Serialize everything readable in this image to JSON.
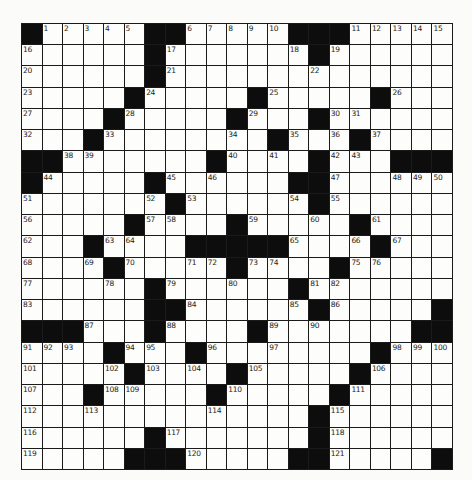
{
  "puzzle": {
    "rows": 21,
    "cols": 21,
    "legend": {
      "black": "#",
      "white": "."
    },
    "grid": [
      [
        "#",
        "1",
        "2",
        "3",
        "4",
        "5",
        "#",
        "#",
        "6",
        "7",
        "8",
        "9",
        "10",
        "#",
        "#",
        "#",
        "11",
        "12",
        "13",
        "14",
        "15"
      ],
      [
        "16",
        ".",
        ".",
        ".",
        ".",
        ".",
        "#",
        "17",
        ".",
        ".",
        ".",
        ".",
        ".",
        "18",
        "#",
        "19",
        ".",
        ".",
        ".",
        ".",
        "."
      ],
      [
        "20",
        ".",
        ".",
        ".",
        ".",
        ".",
        "#",
        "21",
        ".",
        ".",
        ".",
        ".",
        ".",
        ".",
        "22",
        ".",
        ".",
        ".",
        ".",
        ".",
        "."
      ],
      [
        "23",
        ".",
        ".",
        ".",
        ".",
        "#",
        "24",
        ".",
        ".",
        ".",
        ".",
        "#",
        "25",
        ".",
        ".",
        ".",
        ".",
        "#",
        "26",
        ".",
        "."
      ],
      [
        "27",
        ".",
        ".",
        ".",
        "#",
        "28",
        ".",
        ".",
        ".",
        ".",
        "#",
        "29",
        ".",
        ".",
        "#",
        "30",
        "31",
        ".",
        ".",
        ".",
        "."
      ],
      [
        "32",
        ".",
        ".",
        "#",
        "33",
        ".",
        ".",
        ".",
        ".",
        ".",
        "34",
        ".",
        "#",
        "35",
        ".",
        "36",
        "#",
        "37",
        ".",
        ".",
        "."
      ],
      [
        "#",
        "#",
        "38",
        "39",
        ".",
        ".",
        ".",
        ".",
        ".",
        "#",
        "40",
        ".",
        "41",
        ".",
        "#",
        "42",
        "43",
        ".",
        "#",
        "#",
        "#"
      ],
      [
        "#",
        "44",
        ".",
        ".",
        ".",
        ".",
        "#",
        "45",
        ".",
        "46",
        ".",
        ".",
        ".",
        "#",
        "#",
        "47",
        ".",
        ".",
        "48",
        "49",
        "50"
      ],
      [
        "51",
        ".",
        ".",
        ".",
        ".",
        ".",
        "52",
        "#",
        "53",
        ".",
        ".",
        ".",
        ".",
        "54",
        "#",
        "55",
        ".",
        ".",
        ".",
        ".",
        "."
      ],
      [
        "56",
        ".",
        ".",
        ".",
        ".",
        "#",
        "57",
        "58",
        ".",
        ".",
        "#",
        "59",
        ".",
        ".",
        "60",
        ".",
        "#",
        "61",
        ".",
        ".",
        "."
      ],
      [
        "62",
        ".",
        ".",
        "#",
        "63",
        "64",
        ".",
        ".",
        "#",
        "#",
        "#",
        "#",
        "#",
        "65",
        ".",
        ".",
        "66",
        "#",
        "67",
        ".",
        "."
      ],
      [
        "68",
        ".",
        ".",
        "69",
        "#",
        "70",
        ".",
        ".",
        "71",
        "72",
        "#",
        "73",
        "74",
        ".",
        ".",
        "#",
        "75",
        "76",
        ".",
        ".",
        "."
      ],
      [
        "77",
        ".",
        ".",
        ".",
        "78",
        ".",
        "#",
        "79",
        ".",
        ".",
        "80",
        ".",
        ".",
        "#",
        "81",
        "82",
        ".",
        ".",
        ".",
        ".",
        "."
      ],
      [
        "83",
        ".",
        ".",
        ".",
        ".",
        ".",
        "#",
        "#",
        "84",
        ".",
        ".",
        ".",
        ".",
        "85",
        "#",
        "86",
        ".",
        ".",
        ".",
        ".",
        "#"
      ],
      [
        "#",
        "#",
        "#",
        "87",
        ".",
        ".",
        "#",
        "88",
        ".",
        ".",
        ".",
        "#",
        "89",
        ".",
        "90",
        ".",
        ".",
        ".",
        ".",
        "#",
        "#"
      ],
      [
        "91",
        "92",
        "93",
        ".",
        "#",
        "94",
        "95",
        ".",
        "#",
        "96",
        ".",
        ".",
        "97",
        ".",
        ".",
        ".",
        ".",
        "#",
        "98",
        "99",
        "100"
      ],
      [
        "101",
        ".",
        ".",
        ".",
        "102",
        "#",
        "103",
        ".",
        "104",
        ".",
        "#",
        "105",
        ".",
        ".",
        ".",
        ".",
        "#",
        "106",
        ".",
        ".",
        "."
      ],
      [
        "107",
        ".",
        ".",
        "#",
        "108",
        "109",
        ".",
        ".",
        ".",
        "#",
        "110",
        ".",
        ".",
        ".",
        ".",
        "#",
        "111",
        ".",
        ".",
        ".",
        "."
      ],
      [
        "112",
        ".",
        ".",
        "113",
        ".",
        ".",
        ".",
        ".",
        ".",
        "114",
        ".",
        ".",
        ".",
        ".",
        "#",
        "115",
        ".",
        ".",
        ".",
        ".",
        "."
      ],
      [
        "116",
        ".",
        ".",
        ".",
        ".",
        ".",
        "#",
        "117",
        ".",
        ".",
        ".",
        ".",
        ".",
        ".",
        "#",
        "118",
        ".",
        ".",
        ".",
        ".",
        "."
      ],
      [
        "119",
        ".",
        ".",
        ".",
        ".",
        "#",
        "#",
        "#",
        "120",
        ".",
        ".",
        ".",
        ".",
        "#",
        "#",
        "121",
        ".",
        ".",
        ".",
        ".",
        "#"
      ]
    ]
  },
  "colors": {
    "black_cell": "#0d0d0d",
    "white_cell": "#fdfdfb",
    "grid_line": "#1a1a1a",
    "page": "#fbfbf9"
  }
}
